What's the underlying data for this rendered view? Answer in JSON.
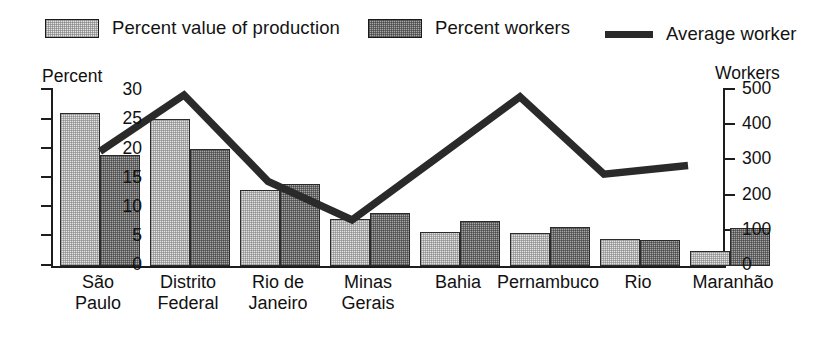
{
  "legend": {
    "items": [
      {
        "label": "Percent value of production",
        "style": "light-swatch",
        "color": "#e2e2e2"
      },
      {
        "label": "Percent workers",
        "style": "dark-swatch",
        "color": "#a6a6a6"
      },
      {
        "label": "Average worker",
        "style": "line-swatch",
        "color": "#2a2a2a"
      }
    ]
  },
  "axes": {
    "left_title": "Percent",
    "right_title": "Workers",
    "left_ticks": [
      "0",
      "5",
      "10",
      "15",
      "20",
      "25",
      "30"
    ],
    "right_ticks": [
      "0",
      "100",
      "200",
      "300",
      "400",
      "500"
    ]
  },
  "xlabels": {
    "rgs_line2": "Grande do Sul"
  },
  "chart_data": {
    "type": "bar",
    "title": "",
    "subtitle": "",
    "xlabel": "",
    "ylabel": "Percent",
    "y2label": "Workers",
    "ylim": [
      0,
      30
    ],
    "y2lim": [
      0,
      500
    ],
    "grid": false,
    "legend_position": "top",
    "categories": [
      "São Paulo",
      "Distrito Federal",
      "Rio de Janeiro",
      "Minas Gerais",
      "Bahia",
      "Pernambuco",
      "Rio Grande do Sul",
      "Maranhão"
    ],
    "category_lines": [
      [
        "São",
        "Paulo"
      ],
      [
        "Distrito",
        "Federal"
      ],
      [
        "Rio de",
        "Janeiro"
      ],
      [
        "Minas",
        "Gerais"
      ],
      [
        "Bahia"
      ],
      [
        "Pernambuco"
      ],
      [
        "Rio",
        "Grande do Sul"
      ],
      [
        "Maranhão"
      ]
    ],
    "series": [
      {
        "name": "Percent value of production",
        "type": "bar",
        "axis": "left",
        "values": [
          26.0,
          25.0,
          13.0,
          8.0,
          5.8,
          5.6,
          4.6,
          2.5
        ]
      },
      {
        "name": "Percent workers",
        "type": "bar",
        "axis": "left",
        "values": [
          19.0,
          20.0,
          14.0,
          9.0,
          7.7,
          6.6,
          4.5,
          6.4
        ]
      },
      {
        "name": "Average worker",
        "type": "line",
        "axis": "right",
        "values": [
          320,
          480,
          235,
          125,
          300,
          475,
          255,
          280
        ]
      }
    ]
  }
}
